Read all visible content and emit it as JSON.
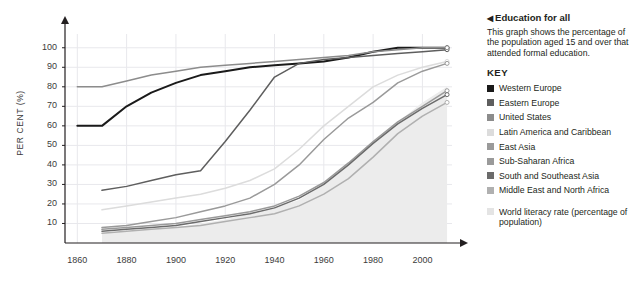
{
  "callout": {
    "arrow": "◀",
    "title": "Education for all",
    "description": "This graph shows the percentage of the population aged 15 and over that attended formal education."
  },
  "key": {
    "title": "KEY",
    "items": [
      {
        "label": "Western Europe",
        "color": "#1a1a1a"
      },
      {
        "label": "Eastern Europe",
        "color": "#5e5e5e"
      },
      {
        "label": "United States",
        "color": "#8c8c8c"
      },
      {
        "label": "Latin America and Caribbean",
        "color": "#dcdcdc"
      },
      {
        "label": "East Asia",
        "color": "#9a9a9a"
      },
      {
        "label": "Sub-Saharan Africa",
        "color": "#9a9a9a"
      },
      {
        "label": "South and Southeast Asia",
        "color": "#6b6b6b"
      },
      {
        "label": "Middle East and North Africa",
        "color": "#b0b0b0"
      }
    ],
    "footnote": {
      "label": "World literacy rate (percentage of population)",
      "color": "#e4e4e4"
    }
  },
  "chart_data": {
    "type": "line",
    "title": "",
    "xlabel": "",
    "ylabel": "PER CENT (%)",
    "xlim": [
      1855,
      2012
    ],
    "ylim": [
      0,
      105
    ],
    "xticks": [
      1860,
      1880,
      1900,
      1920,
      1940,
      1960,
      1980,
      2000
    ],
    "yticks": [
      10,
      20,
      30,
      40,
      50,
      60,
      70,
      80,
      90,
      100
    ],
    "grid": true,
    "legend_position": "right",
    "axis_arrows": true,
    "endpoint_markers": true,
    "area": {
      "name": "World literacy rate (percentage of population)",
      "color": "#ececec",
      "x": [
        1870,
        1900,
        1920,
        1940,
        1950,
        1960,
        1970,
        1980,
        1990,
        2000,
        2010
      ],
      "values": [
        5,
        8,
        12,
        18,
        22,
        30,
        40,
        52,
        62,
        72,
        80
      ]
    },
    "series": [
      {
        "name": "Western Europe",
        "color": "#1a1a1a",
        "x": [
          1860,
          1870,
          1880,
          1890,
          1900,
          1910,
          1920,
          1930,
          1940,
          1950,
          1960,
          1970,
          1980,
          1990,
          2000,
          2010
        ],
        "values": [
          60,
          60,
          70,
          77,
          82,
          86,
          88,
          90,
          91,
          92,
          93,
          95,
          98,
          100,
          100,
          100
        ]
      },
      {
        "name": "Eastern Europe",
        "color": "#5e5e5e",
        "x": [
          1870,
          1880,
          1890,
          1900,
          1910,
          1920,
          1930,
          1940,
          1950,
          1960,
          1970,
          1980,
          1990,
          2000,
          2010
        ],
        "values": [
          27,
          29,
          32,
          35,
          37,
          52,
          68,
          85,
          92,
          94,
          95,
          96,
          97,
          98,
          99
        ]
      },
      {
        "name": "United States",
        "color": "#8c8c8c",
        "x": [
          1860,
          1870,
          1880,
          1890,
          1900,
          1910,
          1920,
          1930,
          1940,
          1950,
          1960,
          1970,
          1980,
          1990,
          2000,
          2010
        ],
        "values": [
          80,
          80,
          83,
          86,
          88,
          90,
          91,
          92,
          93,
          94,
          95,
          96,
          98,
          99,
          100,
          100
        ]
      },
      {
        "name": "Latin America and Caribbean",
        "color": "#dcdcdc",
        "x": [
          1870,
          1880,
          1890,
          1900,
          1910,
          1920,
          1930,
          1940,
          1950,
          1960,
          1970,
          1980,
          1990,
          2000,
          2010
        ],
        "values": [
          17,
          19,
          21,
          23,
          25,
          28,
          32,
          38,
          48,
          60,
          70,
          80,
          86,
          90,
          93
        ]
      },
      {
        "name": "East Asia",
        "color": "#9a9a9a",
        "x": [
          1870,
          1880,
          1890,
          1900,
          1910,
          1920,
          1930,
          1940,
          1950,
          1960,
          1970,
          1980,
          1990,
          2000,
          2010
        ],
        "values": [
          8,
          9,
          11,
          13,
          16,
          19,
          23,
          30,
          40,
          53,
          64,
          72,
          82,
          88,
          92
        ]
      },
      {
        "name": "Sub-Saharan Africa",
        "color": "#9a9a9a",
        "x": [
          1870,
          1880,
          1890,
          1900,
          1910,
          1920,
          1930,
          1940,
          1950,
          1960,
          1970,
          1980,
          1990,
          2000,
          2010
        ],
        "values": [
          7,
          8,
          9,
          10,
          12,
          14,
          16,
          19,
          24,
          31,
          41,
          52,
          62,
          70,
          78
        ]
      },
      {
        "name": "South and Southeast Asia",
        "color": "#6b6b6b",
        "x": [
          1870,
          1880,
          1890,
          1900,
          1910,
          1920,
          1930,
          1940,
          1950,
          1960,
          1970,
          1980,
          1990,
          2000,
          2010
        ],
        "values": [
          6,
          7,
          8,
          9,
          11,
          13,
          15,
          18,
          23,
          30,
          40,
          51,
          61,
          69,
          76
        ]
      },
      {
        "name": "Middle East and North Africa",
        "color": "#b0b0b0",
        "x": [
          1870,
          1880,
          1890,
          1900,
          1910,
          1920,
          1930,
          1940,
          1950,
          1960,
          1970,
          1980,
          1990,
          2000,
          2010
        ],
        "values": [
          5,
          6,
          7,
          8,
          9,
          11,
          13,
          15,
          19,
          25,
          33,
          44,
          56,
          65,
          72
        ]
      }
    ]
  }
}
